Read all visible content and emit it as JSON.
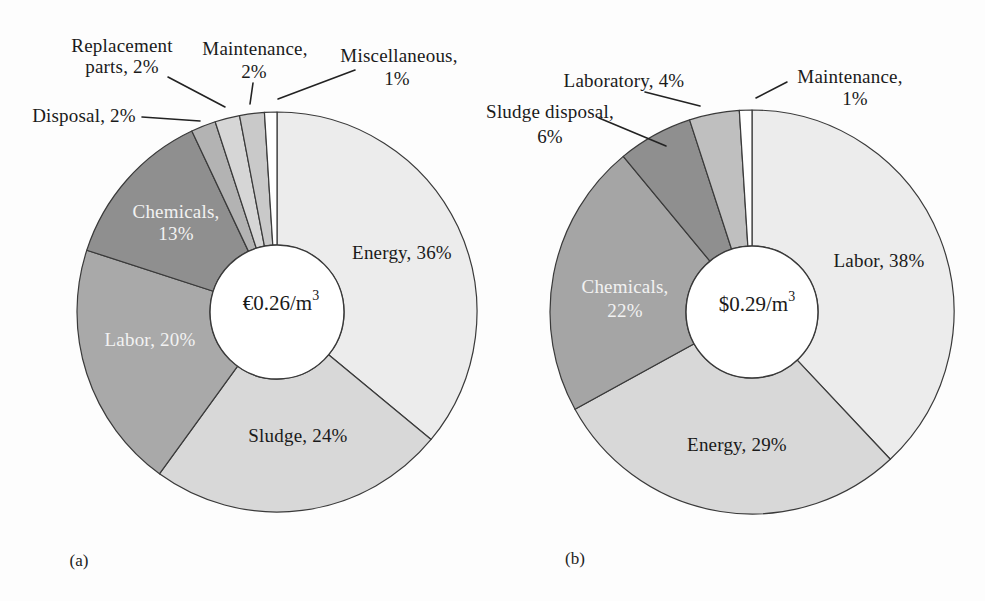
{
  "colors": {
    "background": "#fdfdfd",
    "slice_stroke": "#3a3a3a",
    "leader_line": "#222222",
    "text": "#1a1a1a",
    "text_light": "#f2f2f2"
  },
  "chart_data": [
    {
      "type": "pie",
      "subtype": "donut",
      "id": "a",
      "caption": "(a)",
      "center_label": "€0.26/m³",
      "start_angle": "top",
      "direction": "clockwise",
      "categories": [
        "Energy",
        "Sludge",
        "Labor",
        "Chemicals",
        "Disposal",
        "Replacement parts",
        "Maintenance",
        "Miscellaneous"
      ],
      "values": [
        36,
        24,
        20,
        13,
        2,
        2,
        2,
        1
      ],
      "slices": [
        {
          "label": "Energy",
          "value": 36,
          "color": "#ececec",
          "text_color": "#1a1a1a",
          "lines": [
            "Energy, 36%"
          ]
        },
        {
          "label": "Sludge",
          "value": 24,
          "color": "#d8d8d8",
          "text_color": "#1a1a1a",
          "lines": [
            "Sludge, 24%"
          ]
        },
        {
          "label": "Labor",
          "value": 20,
          "color": "#a9a9a9",
          "text_color": "#f2f2f2",
          "lines": [
            "Labor, 20%"
          ]
        },
        {
          "label": "Chemicals",
          "value": 13,
          "color": "#8f8f8f",
          "text_color": "#f2f2f2",
          "lines": [
            "Chemicals,",
            "13%"
          ]
        },
        {
          "label": "Disposal",
          "value": 2,
          "color": "#b3b3b3",
          "text_color": "#1a1a1a",
          "lines": [
            "Disposal, 2%"
          ]
        },
        {
          "label": "Replacement parts",
          "value": 2,
          "color": "#d6d6d6",
          "text_color": "#1a1a1a",
          "lines": [
            "Replacement",
            "parts, 2%"
          ]
        },
        {
          "label": "Maintenance",
          "value": 2,
          "color": "#c9c9c9",
          "text_color": "#1a1a1a",
          "lines": [
            "Maintenance,",
            "2%"
          ]
        },
        {
          "label": "Miscellaneous",
          "value": 1,
          "color": "#ffffff",
          "text_color": "#1a1a1a",
          "lines": [
            "Miscellaneous,",
            "1%"
          ]
        }
      ]
    },
    {
      "type": "pie",
      "subtype": "donut",
      "id": "b",
      "caption": "(b)",
      "center_label": "$0.29/m³",
      "start_angle": "top",
      "direction": "clockwise",
      "categories": [
        "Labor",
        "Energy",
        "Chemicals",
        "Sludge disposal",
        "Laboratory",
        "Maintenance"
      ],
      "values": [
        38,
        29,
        22,
        6,
        4,
        1
      ],
      "slices": [
        {
          "label": "Labor",
          "value": 38,
          "color": "#ececec",
          "text_color": "#1a1a1a",
          "lines": [
            "Labor, 38%"
          ]
        },
        {
          "label": "Energy",
          "value": 29,
          "color": "#d8d8d8",
          "text_color": "#1a1a1a",
          "lines": [
            "Energy, 29%"
          ]
        },
        {
          "label": "Chemicals",
          "value": 22,
          "color": "#a5a5a5",
          "text_color": "#f2f2f2",
          "lines": [
            "Chemicals,",
            "22%"
          ]
        },
        {
          "label": "Sludge disposal",
          "value": 6,
          "color": "#8f8f8f",
          "text_color": "#1a1a1a",
          "lines": [
            "Sludge disposal,",
            "6%"
          ]
        },
        {
          "label": "Laboratory",
          "value": 4,
          "color": "#bfbfbf",
          "text_color": "#1a1a1a",
          "lines": [
            "Laboratory, 4%"
          ]
        },
        {
          "label": "Maintenance",
          "value": 1,
          "color": "#ffffff",
          "text_color": "#1a1a1a",
          "lines": [
            "Maintenance,",
            "1%"
          ]
        }
      ]
    }
  ]
}
